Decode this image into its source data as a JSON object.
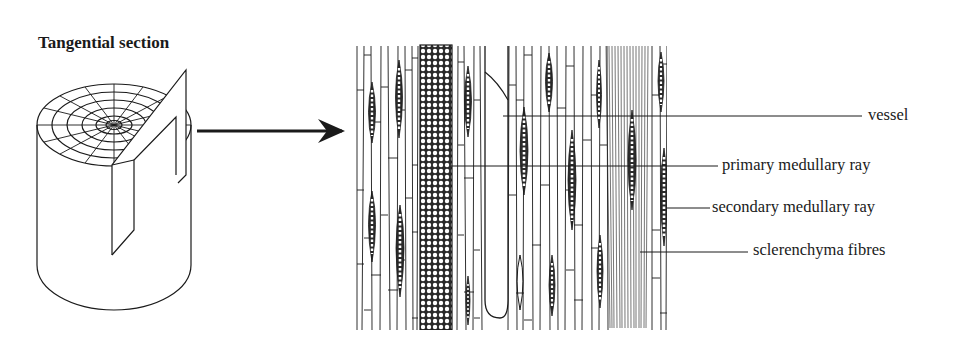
{
  "title": "Tangential section",
  "labels": {
    "vessel": "vessel",
    "primary_ray": "primary medullary ray",
    "secondary_ray": "secondary medullary ray",
    "fibres": "sclerenchyma fibres"
  },
  "colors": {
    "ink": "#1a1a1a",
    "background": "#ffffff"
  }
}
